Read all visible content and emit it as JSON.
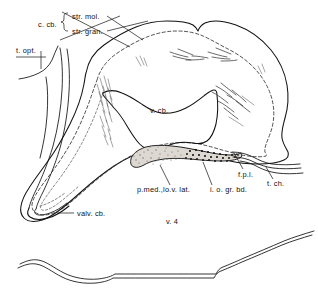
{
  "figure": {
    "kind": "anatomical-line-drawing",
    "figure_number_label": "v. 4",
    "background_color": "#ffffff",
    "ink_color": "#111111",
    "stipple_fill_color": "#ddd9d2"
  },
  "labels": {
    "c_cb": "c. cb.",
    "str_mol": "str. mol.",
    "str_gran": "str. gran.",
    "t_opt": "t. opt.",
    "v_cb": "v. cb.",
    "valv_cb": "valv. cb.",
    "p_med_lo_v_lat": "p.med.,lo.v. lat.",
    "i_o_gr_bd": "i. o. gr. bd.",
    "f_p_l": "f.p.l.",
    "t_ch": "t. ch.",
    "v_4": "v. 4"
  },
  "label_list": [
    {
      "id": "c-cb",
      "text": "c. cb.",
      "x": 38,
      "y": 24,
      "anchor": "start"
    },
    {
      "id": "str-mol",
      "text": "str. mol.",
      "x": 72,
      "y": 19,
      "anchor": "start"
    },
    {
      "id": "str-gran",
      "text": "str. gran.",
      "x": 72,
      "y": 33,
      "anchor": "start"
    },
    {
      "id": "t-opt",
      "text": "t. opt.",
      "x": 16,
      "y": 50,
      "anchor": "start"
    },
    {
      "id": "v-cb",
      "text": "v. cb.",
      "x": 150,
      "y": 112,
      "anchor": "start"
    },
    {
      "id": "valv-cb",
      "text": "valv. cb.",
      "x": 77,
      "y": 216,
      "anchor": "start"
    },
    {
      "id": "p-med-lo-v-lat",
      "text": "p.med.,lo.v. lat.",
      "x": 138,
      "y": 191,
      "anchor": "start"
    },
    {
      "id": "i-o-gr-bd",
      "text": "i. o. gr. bd.",
      "x": 211,
      "y": 191,
      "anchor": "start"
    },
    {
      "id": "f-p-l",
      "text": "f.p.l.",
      "x": 239,
      "y": 175,
      "anchor": "start"
    },
    {
      "id": "t-ch",
      "text": "t. ch.",
      "x": 268,
      "y": 185,
      "anchor": "start"
    },
    {
      "id": "v-4",
      "text": "v. 4",
      "x": 172,
      "y": 223,
      "anchor": "middle"
    }
  ]
}
